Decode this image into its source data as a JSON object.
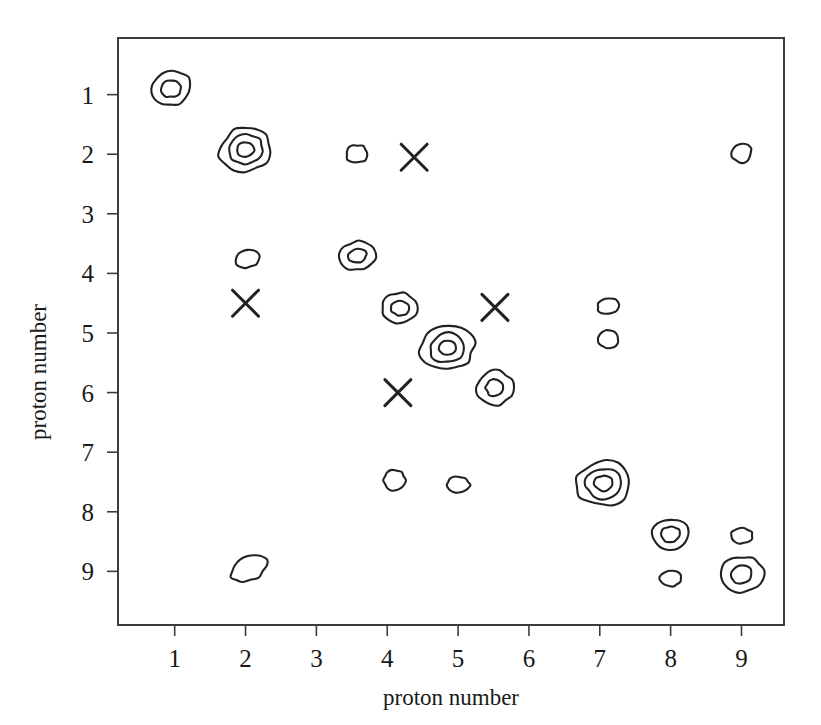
{
  "chart_data": {
    "type": "scatter",
    "title": "",
    "xlabel": "proton number",
    "ylabel": "proton number",
    "xlim": [
      0.2,
      9.6
    ],
    "ylim": [
      0.05,
      9.9
    ],
    "y_axis_inverted": true,
    "grid": false,
    "legend": "none",
    "xticks": [
      1,
      2,
      3,
      4,
      5,
      6,
      7,
      8,
      9
    ],
    "yticks": [
      1,
      2,
      3,
      4,
      5,
      6,
      7,
      8,
      9
    ],
    "xticklabels": [
      "1",
      "2",
      "3",
      "4",
      "5",
      "6",
      "7",
      "8",
      "9"
    ],
    "yticklabels": [
      "1",
      "2",
      "3",
      "4",
      "5",
      "6",
      "7",
      "8",
      "9"
    ],
    "marker_encoding": {
      "contour": "nested closed ellipses; more rings = higher value",
      "cross": "X symbol marks a separate category"
    },
    "series": [
      {
        "name": "contour markers",
        "marker": "nested-ellipse",
        "points": [
          {
            "x": 0.95,
            "y": 0.9,
            "rings": 2,
            "rx": 20,
            "ry": 17,
            "rot": -12
          },
          {
            "x": 2.0,
            "y": 1.92,
            "rings": 3,
            "rx": 26,
            "ry": 22,
            "rot": -14
          },
          {
            "x": 3.57,
            "y": 2.0,
            "rings": 1,
            "rx": 11,
            "ry": 9,
            "rot": -8
          },
          {
            "x": 9.0,
            "y": 1.98,
            "rings": 1,
            "rx": 10,
            "ry": 10,
            "rot": 0
          },
          {
            "x": 2.02,
            "y": 3.75,
            "rings": 1,
            "rx": 12,
            "ry": 9,
            "rot": -10
          },
          {
            "x": 3.58,
            "y": 3.7,
            "rings": 2,
            "rx": 18,
            "ry": 14,
            "rot": -12
          },
          {
            "x": 4.18,
            "y": 4.58,
            "rings": 2,
            "rx": 18,
            "ry": 15,
            "rot": 0
          },
          {
            "x": 7.12,
            "y": 4.55,
            "rings": 1,
            "rx": 11,
            "ry": 8,
            "rot": -5
          },
          {
            "x": 7.12,
            "y": 5.1,
            "rings": 1,
            "rx": 10,
            "ry": 9,
            "rot": 0
          },
          {
            "x": 4.85,
            "y": 5.25,
            "rings": 3,
            "rx": 27,
            "ry": 22,
            "rot": -10
          },
          {
            "x": 5.52,
            "y": 5.92,
            "rings": 2,
            "rx": 18,
            "ry": 17,
            "rot": 0
          },
          {
            "x": 4.1,
            "y": 7.47,
            "rings": 1,
            "rx": 11,
            "ry": 10,
            "rot": 0
          },
          {
            "x": 5.0,
            "y": 7.55,
            "rings": 1,
            "rx": 12,
            "ry": 8,
            "rot": 0
          },
          {
            "x": 7.05,
            "y": 7.52,
            "rings": 3,
            "rx": 27,
            "ry": 23,
            "rot": -8
          },
          {
            "x": 8.0,
            "y": 8.38,
            "rings": 2,
            "rx": 19,
            "ry": 16,
            "rot": -8
          },
          {
            "x": 9.0,
            "y": 8.4,
            "rings": 1,
            "rx": 11,
            "ry": 8,
            "rot": 0
          },
          {
            "x": 8.0,
            "y": 9.12,
            "rings": 1,
            "rx": 11,
            "ry": 8,
            "rot": 0
          },
          {
            "x": 9.0,
            "y": 9.05,
            "rings": 2,
            "rx": 22,
            "ry": 18,
            "rot": -10
          },
          {
            "x": 2.05,
            "y": 8.95,
            "rings": 1,
            "rx": 19,
            "ry": 12,
            "rot": -26
          }
        ]
      },
      {
        "name": "cross markers",
        "marker": "x",
        "points": [
          {
            "x": 4.38,
            "y": 2.05
          },
          {
            "x": 2.0,
            "y": 4.5
          },
          {
            "x": 5.52,
            "y": 4.57
          },
          {
            "x": 4.15,
            "y": 6.0
          }
        ]
      }
    ]
  },
  "figure": {
    "x_axis_title": "proton number",
    "y_axis_title": "proton number"
  }
}
